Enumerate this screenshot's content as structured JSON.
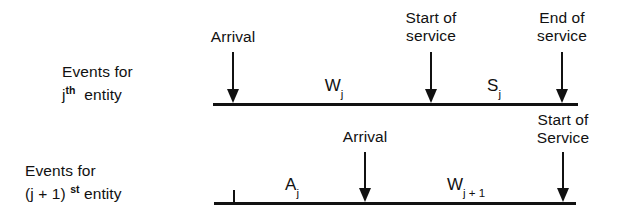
{
  "diagram": {
    "background_color": "#ffffff",
    "line_color": "#111111"
  },
  "rows": [
    {
      "id": "row-j",
      "label_line1": "Events for",
      "label_line2_prefix": "j",
      "label_line2_sup": "th",
      "label_line2_suffix": "entity",
      "axis": {
        "x_start": 213,
        "x_end": 578,
        "y": 104,
        "thickness": 3
      },
      "events": [
        {
          "name": "arrival",
          "label_line1": "Arrival",
          "label_line2": "",
          "x": 233
        },
        {
          "name": "start-of-service",
          "label_line1": "Start of",
          "label_line2": "service",
          "x": 431
        },
        {
          "name": "end-of-service",
          "label_line1": "End of",
          "label_line2": "service",
          "x": 562
        }
      ],
      "intervals": [
        {
          "name": "waiting-time",
          "symbol": "W",
          "subscript": "j",
          "x": 334
        },
        {
          "name": "service-time",
          "symbol": "S",
          "subscript": "j",
          "x": 494
        }
      ],
      "ticks": []
    },
    {
      "id": "row-j-plus-1",
      "label_line1": "Events for",
      "label_line2_prefix": "(j + 1)",
      "label_line2_sup": "st",
      "label_line2_suffix": "entity",
      "axis": {
        "x_start": 214,
        "x_end": 576,
        "y": 203,
        "thickness": 3
      },
      "events": [
        {
          "name": "arrival",
          "label_line1": "Arrival",
          "label_line2": "",
          "x": 365
        },
        {
          "name": "start-of-service",
          "label_line1": "Start of",
          "label_line2": "Service",
          "x": 563
        }
      ],
      "intervals": [
        {
          "name": "interarrival-time",
          "symbol": "A",
          "subscript": "j",
          "x": 292
        },
        {
          "name": "waiting-time",
          "symbol": "W",
          "subscript": "j + 1",
          "x": 466
        }
      ],
      "ticks": [
        {
          "name": "previous-arrival-tick",
          "x": 234,
          "height": 13
        }
      ]
    }
  ]
}
